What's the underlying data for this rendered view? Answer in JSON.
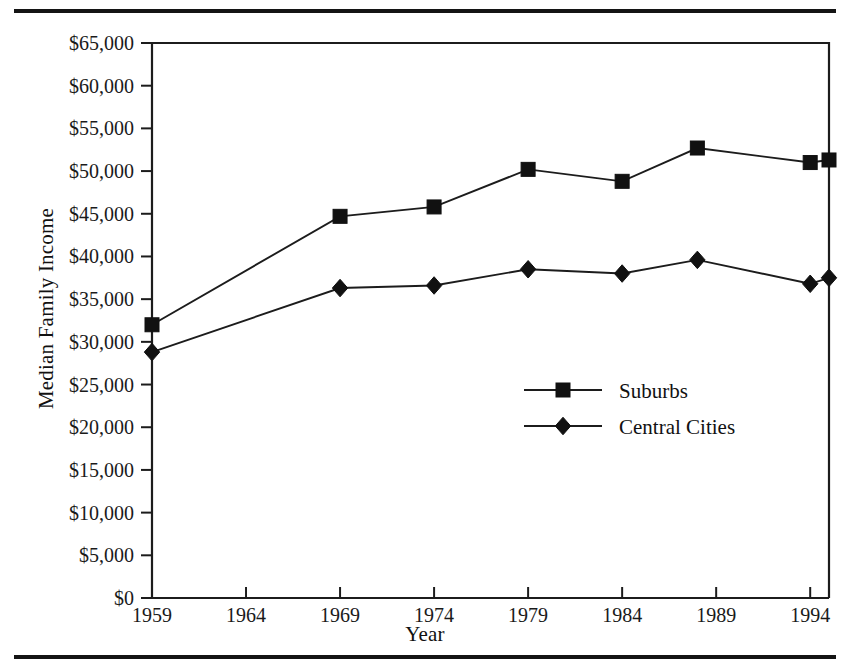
{
  "chart_data": {
    "type": "line",
    "title": "",
    "xlabel": "Year",
    "ylabel": "Median Family Income",
    "xlim": [
      1959,
      1995
    ],
    "ylim": [
      0,
      65000
    ],
    "grid": false,
    "legend_position": "center-right-inside",
    "x_ticks": [
      1959,
      1964,
      1969,
      1974,
      1979,
      1984,
      1989,
      1994
    ],
    "x_tick_labels": [
      "1959",
      "1964",
      "1969",
      "1974",
      "1979",
      "1984",
      "1989",
      "1994"
    ],
    "y_ticks": [
      0,
      5000,
      10000,
      15000,
      20000,
      25000,
      30000,
      35000,
      40000,
      45000,
      50000,
      55000,
      60000,
      65000
    ],
    "y_tick_labels": [
      "$0",
      "$5,000",
      "$10,000",
      "$15,000",
      "$20,000",
      "$25,000",
      "$30,000",
      "$35,000",
      "$40,000",
      "$45,000",
      "$50,000",
      "$55,000",
      "$60,000",
      "$65,000"
    ],
    "series": [
      {
        "name": "Suburbs",
        "marker": "square",
        "x": [
          1959,
          1969,
          1974,
          1979,
          1984,
          1988,
          1994,
          1995
        ],
        "values": [
          32000,
          44700,
          45800,
          50200,
          48800,
          52700,
          51000,
          51300
        ]
      },
      {
        "name": "Central Cities",
        "marker": "diamond",
        "x": [
          1959,
          1969,
          1974,
          1979,
          1984,
          1988,
          1994,
          1995
        ],
        "values": [
          28800,
          36300,
          36600,
          38500,
          38000,
          39600,
          36800,
          37500
        ]
      }
    ]
  },
  "legend": {
    "entries": [
      {
        "label": "Suburbs",
        "marker": "square"
      },
      {
        "label": "Central Cities",
        "marker": "diamond"
      }
    ]
  },
  "colors": {
    "ink": "#111111",
    "rule": "#141414",
    "background": "#ffffff"
  }
}
